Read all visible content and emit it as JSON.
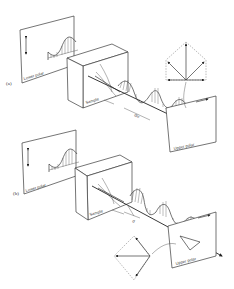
{
  "figure": {
    "panel_a": {
      "label": "(a)",
      "lower_polar_label": "Lower polar",
      "sample_label": "Sample",
      "upper_polar_label": "Upper polar",
      "path_label": "d/c"
    },
    "panel_b": {
      "label": "(b)",
      "lower_polar_label": "Lower polar",
      "sample_label": "Sample",
      "upper_polar_label": "Upper polar",
      "path_label": "d"
    },
    "colors": {
      "line": "#3a3a3a",
      "background": "#ffffff"
    }
  }
}
